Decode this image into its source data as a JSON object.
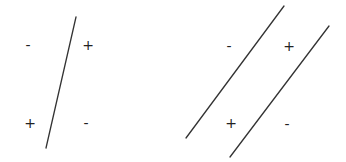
{
  "diagrams": [
    {
      "name": "single-boundary",
      "lines": [
        {
          "x1": 76,
          "y1": 17,
          "x2": 46,
          "y2": 148
        }
      ],
      "labels": [
        {
          "text": "-",
          "x": 28,
          "y": 50
        },
        {
          "text": "+",
          "x": 88,
          "y": 50
        },
        {
          "text": "+",
          "x": 30,
          "y": 128
        },
        {
          "text": "-",
          "x": 86,
          "y": 128
        }
      ]
    },
    {
      "name": "double-boundary",
      "lines": [
        {
          "x1": 284,
          "y1": 6,
          "x2": 186,
          "y2": 138
        },
        {
          "x1": 329,
          "y1": 26,
          "x2": 230,
          "y2": 157
        }
      ],
      "labels": [
        {
          "text": "-",
          "x": 229,
          "y": 51
        },
        {
          "text": "+",
          "x": 289,
          "y": 51
        },
        {
          "text": "+",
          "x": 231,
          "y": 128
        },
        {
          "text": "-",
          "x": 287,
          "y": 129
        }
      ]
    }
  ],
  "colors": {
    "line": "#333333",
    "text": "#222222",
    "background": "#ffffff"
  }
}
